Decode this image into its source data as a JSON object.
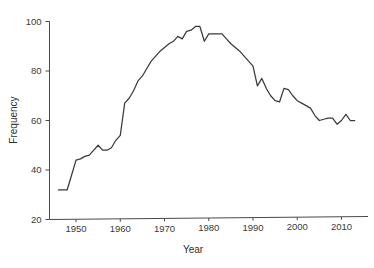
{
  "chart_data": {
    "type": "line",
    "title": "",
    "xlabel": "Year",
    "ylabel": "Frequency",
    "xlim": [
      1944,
      2016
    ],
    "ylim": [
      20,
      100
    ],
    "xticks": [
      1950,
      1960,
      1970,
      1980,
      1990,
      2000,
      2010
    ],
    "xtick_labels": [
      "1950",
      "1960",
      "1970",
      "1980",
      "1990",
      "2000",
      "2010"
    ],
    "yticks": [
      20,
      40,
      60,
      80,
      100
    ],
    "ytick_labels": [
      "20",
      "40",
      "60",
      "80",
      "100"
    ],
    "grid": false,
    "legend": "none",
    "line_color": "#3a3a3a",
    "axis_color": "#4a4a4a",
    "background_color": "#ffffff",
    "x": [
      1946,
      1947,
      1948,
      1949,
      1950,
      1951,
      1952,
      1953,
      1954,
      1955,
      1956,
      1957,
      1958,
      1959,
      1960,
      1961,
      1962,
      1963,
      1964,
      1965,
      1966,
      1967,
      1968,
      1969,
      1970,
      1971,
      1972,
      1973,
      1974,
      1975,
      1976,
      1977,
      1978,
      1979,
      1980,
      1981,
      1982,
      1983,
      1984,
      1985,
      1986,
      1987,
      1988,
      1989,
      1990,
      1991,
      1992,
      1993,
      1994,
      1995,
      1996,
      1997,
      1998,
      1999,
      2000,
      2001,
      2002,
      2003,
      2004,
      2005,
      2006,
      2007,
      2008,
      2009,
      2010,
      2011,
      2012,
      2013
    ],
    "values": [
      32,
      32,
      32,
      38,
      44,
      44.5,
      45.5,
      46,
      48,
      50,
      48,
      48,
      49,
      52,
      54,
      67,
      69,
      72,
      76,
      78,
      81,
      84,
      86,
      88,
      89.5,
      91,
      92,
      94,
      93,
      96,
      96.5,
      98,
      98,
      92,
      95,
      95,
      95,
      95,
      93,
      91,
      89.5,
      88,
      86,
      84,
      82,
      74,
      77,
      73,
      70,
      68,
      67.5,
      73,
      72.5,
      70,
      68,
      67,
      66,
      65,
      62,
      60,
      60.5,
      61,
      61,
      58.5,
      60,
      62.5,
      60,
      60
    ]
  },
  "axis": {
    "y_title": "Frequency",
    "x_title": "Year"
  }
}
